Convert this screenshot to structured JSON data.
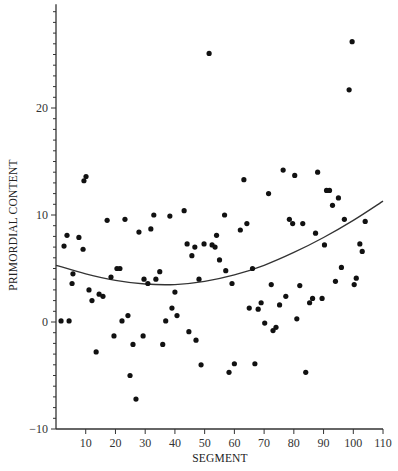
{
  "chart_data": {
    "type": "scatter",
    "title": "",
    "xlabel": "SEGMENT",
    "ylabel": "PRIMORDIAL CONTENT",
    "xlim": [
      0,
      110
    ],
    "ylim": [
      -10,
      29.7
    ],
    "x_ticks": [
      10,
      20,
      30,
      40,
      50,
      60,
      70,
      80,
      90,
      100,
      110
    ],
    "y_ticks": [
      -10,
      0,
      10,
      20
    ],
    "y_minor_step": 1,
    "grid": false,
    "legend": null,
    "series": [
      {
        "name": "observations",
        "kind": "points",
        "points": [
          [
            1.7,
            0.1
          ],
          [
            2.7,
            7.1
          ],
          [
            3.7,
            8.1
          ],
          [
            4.4,
            0.1
          ],
          [
            5.4,
            3.6
          ],
          [
            5.7,
            4.5
          ],
          [
            7.7,
            7.9
          ],
          [
            9.1,
            6.8
          ],
          [
            9.4,
            13.2
          ],
          [
            10.1,
            13.6
          ],
          [
            11.1,
            3.0
          ],
          [
            12.1,
            2.0
          ],
          [
            13.5,
            -2.8
          ],
          [
            14.5,
            2.6
          ],
          [
            15.8,
            2.4
          ],
          [
            17.2,
            9.5
          ],
          [
            18.5,
            4.2
          ],
          [
            19.5,
            -1.3
          ],
          [
            20.5,
            5.0
          ],
          [
            21.5,
            5.0
          ],
          [
            22.2,
            0.1
          ],
          [
            23.2,
            9.6
          ],
          [
            24.2,
            0.6
          ],
          [
            24.9,
            -5.0
          ],
          [
            25.9,
            -2.1
          ],
          [
            26.9,
            -7.2
          ],
          [
            27.9,
            8.4
          ],
          [
            29.3,
            -1.3
          ],
          [
            29.6,
            4.0
          ],
          [
            30.9,
            3.6
          ],
          [
            31.9,
            8.7
          ],
          [
            32.9,
            10.0
          ],
          [
            33.6,
            4.0
          ],
          [
            34.9,
            4.7
          ],
          [
            35.9,
            -2.1
          ],
          [
            36.9,
            0.1
          ],
          [
            38.3,
            9.9
          ],
          [
            39.0,
            1.3
          ],
          [
            40.0,
            2.8
          ],
          [
            40.7,
            0.6
          ],
          [
            43.1,
            10.4
          ],
          [
            44.1,
            7.3
          ],
          [
            44.7,
            -0.9
          ],
          [
            45.7,
            6.2
          ],
          [
            46.7,
            7.0
          ],
          [
            47.1,
            -1.7
          ],
          [
            48.1,
            4.0
          ],
          [
            48.8,
            -4.0
          ],
          [
            49.8,
            7.3
          ],
          [
            51.5,
            25.1
          ],
          [
            52.5,
            7.2
          ],
          [
            53.5,
            7.0
          ],
          [
            54.0,
            8.1
          ],
          [
            55.0,
            5.8
          ],
          [
            56.7,
            10.0
          ],
          [
            57.1,
            4.8
          ],
          [
            58.2,
            -4.7
          ],
          [
            59.2,
            3.6
          ],
          [
            60.0,
            -3.9
          ],
          [
            62.0,
            8.6
          ],
          [
            63.2,
            13.3
          ],
          [
            64.2,
            9.2
          ],
          [
            65.0,
            1.3
          ],
          [
            66.1,
            5.0
          ],
          [
            66.9,
            -3.9
          ],
          [
            68.0,
            1.2
          ],
          [
            69.0,
            1.8
          ],
          [
            70.2,
            -0.1
          ],
          [
            71.5,
            12.0
          ],
          [
            72.4,
            3.5
          ],
          [
            73.0,
            -0.8
          ],
          [
            74.0,
            -0.5
          ],
          [
            75.2,
            1.6
          ],
          [
            76.4,
            14.2
          ],
          [
            77.3,
            2.4
          ],
          [
            78.5,
            9.6
          ],
          [
            79.6,
            9.2
          ],
          [
            80.3,
            13.7
          ],
          [
            81.0,
            0.3
          ],
          [
            82.0,
            3.4
          ],
          [
            83.0,
            9.2
          ],
          [
            84.0,
            -4.7
          ],
          [
            85.3,
            1.8
          ],
          [
            86.3,
            2.2
          ],
          [
            87.3,
            8.3
          ],
          [
            88.0,
            14.0
          ],
          [
            89.5,
            2.2
          ],
          [
            90.3,
            7.2
          ],
          [
            91.0,
            12.3
          ],
          [
            92.0,
            12.3
          ],
          [
            93.0,
            10.9
          ],
          [
            94.0,
            3.8
          ],
          [
            95.0,
            11.6
          ],
          [
            96.0,
            5.1
          ],
          [
            97.0,
            9.6
          ],
          [
            98.6,
            21.7
          ],
          [
            99.6,
            26.2
          ],
          [
            100.3,
            3.5
          ],
          [
            101.0,
            4.1
          ],
          [
            102.2,
            7.3
          ],
          [
            103.0,
            6.6
          ],
          [
            104.0,
            9.4
          ]
        ]
      },
      {
        "name": "fitted curve",
        "kind": "line",
        "x": [
          0,
          10,
          20,
          30,
          40,
          50,
          60,
          70,
          80,
          90,
          100,
          110
        ],
        "y": [
          5.3,
          4.5,
          3.9,
          3.55,
          3.5,
          3.8,
          4.4,
          5.3,
          6.5,
          7.9,
          9.5,
          11.3
        ]
      }
    ]
  },
  "labels": {
    "xlabel": "SEGMENT",
    "ylabel": "PRIMORDIAL CONTENT"
  },
  "colors": {
    "points": "#111111",
    "curve": "#333333",
    "axis": "#333333",
    "background": "#ffffff"
  }
}
